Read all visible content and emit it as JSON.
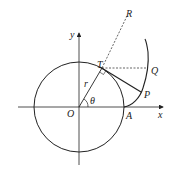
{
  "diagram": {
    "labels": {
      "origin": "O",
      "x_axis": "x",
      "y_axis": "y",
      "point_a": "A",
      "point_t": "T",
      "point_p": "P",
      "point_q": "Q",
      "point_r": "R",
      "radius": "r",
      "angle": "θ"
    },
    "colors": {
      "stroke": "#222222",
      "background": "#ffffff"
    }
  }
}
